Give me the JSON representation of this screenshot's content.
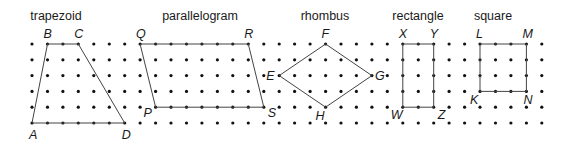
{
  "grid": {
    "origin_x": 32,
    "origin_y": 44,
    "dx": 15.45,
    "dy": 15.8,
    "cols": 34,
    "rows": 6,
    "dot_radius": 1.6,
    "dot_color": "#111111"
  },
  "shapes": [
    {
      "name": "trapezoid",
      "title": "trapezoid",
      "title_x": 56,
      "vertices": [
        {
          "label": "A",
          "col": 0,
          "row": 5,
          "lx": -3,
          "ly": 16
        },
        {
          "label": "B",
          "col": 1,
          "row": 0,
          "lx": -4,
          "ly": -6
        },
        {
          "label": "C",
          "col": 3,
          "row": 0,
          "lx": -4,
          "ly": -6
        },
        {
          "label": "D",
          "col": 6,
          "row": 5,
          "lx": -3,
          "ly": 16
        }
      ]
    },
    {
      "name": "parallelogram",
      "title": "parallelogram",
      "title_x": 200,
      "vertices": [
        {
          "label": "P",
          "col": 8,
          "row": 4,
          "lx": -12,
          "ly": 10
        },
        {
          "label": "Q",
          "col": 7,
          "row": 0,
          "lx": -4,
          "ly": -6
        },
        {
          "label": "R",
          "col": 14,
          "row": 0,
          "lx": -4,
          "ly": -6
        },
        {
          "label": "S",
          "col": 15,
          "row": 4,
          "lx": 4,
          "ly": 10
        }
      ]
    },
    {
      "name": "rhombus",
      "title": "rhombus",
      "title_x": 325,
      "vertices": [
        {
          "label": "E",
          "col": 16,
          "row": 2,
          "lx": -13,
          "ly": 4
        },
        {
          "label": "F",
          "col": 19,
          "row": 0,
          "lx": -4,
          "ly": -6
        },
        {
          "label": "G",
          "col": 22,
          "row": 2,
          "lx": 3,
          "ly": 4
        },
        {
          "label": "H",
          "col": 19,
          "row": 4,
          "lx": -10,
          "ly": 13
        }
      ]
    },
    {
      "name": "rectangle",
      "title": "rectangle",
      "title_x": 418,
      "vertices": [
        {
          "label": "W",
          "col": 24,
          "row": 4,
          "lx": -12,
          "ly": 12
        },
        {
          "label": "X",
          "col": 24,
          "row": 0,
          "lx": -4,
          "ly": -6
        },
        {
          "label": "Y",
          "col": 26,
          "row": 0,
          "lx": -4,
          "ly": -6
        },
        {
          "label": "Z",
          "col": 26,
          "row": 4,
          "lx": 4,
          "ly": 12
        }
      ]
    },
    {
      "name": "square",
      "title": "square",
      "title_x": 493,
      "vertices": [
        {
          "label": "K",
          "col": 29,
          "row": 3,
          "lx": -10,
          "ly": 13
        },
        {
          "label": "L",
          "col": 29,
          "row": 0,
          "lx": -4,
          "ly": -6
        },
        {
          "label": "M",
          "col": 32,
          "row": 0,
          "lx": -4,
          "ly": -6
        },
        {
          "label": "N",
          "col": 32,
          "row": 3,
          "lx": -3,
          "ly": 13
        }
      ]
    }
  ],
  "title_y": 20
}
